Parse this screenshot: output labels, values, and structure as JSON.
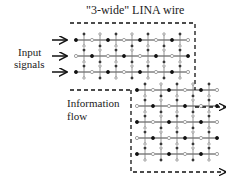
{
  "title": "\"3-wide\" LINA wire",
  "labels": {
    "input_line1": "Input",
    "input_line2": "signals",
    "flow_line1": "Information",
    "flow_line2": "flow"
  },
  "colors": {
    "line": "#111111",
    "node_filled": "#111111",
    "node_open": "#888888"
  },
  "upper_block": {
    "x": [
      76,
      92,
      108,
      124,
      140,
      156,
      172,
      188
    ],
    "rows_y": [
      40,
      56,
      72
    ]
  },
  "lower_block": {
    "x": [
      137,
      153,
      169,
      185,
      201,
      217
    ],
    "rows_y": [
      90,
      106,
      122,
      138,
      154
    ]
  },
  "input_arrows_y": [
    40,
    56,
    72
  ],
  "output_arrows_y": [
    107,
    174
  ]
}
